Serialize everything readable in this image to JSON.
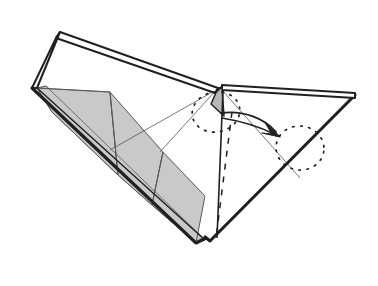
{
  "figure": {
    "type": "origami-instruction",
    "background_color": "#ffffff",
    "canvas": {
      "width": 378,
      "height": 286
    }
  },
  "palette": {
    "paper_white": "#ffffff",
    "paper_gray": "#c9c9c9",
    "paper_gray_dark": "#b8b8b8",
    "outline_dark": "#231f20",
    "outline_thin": "#3a3a3a",
    "crease_line": "#555555",
    "arrow_color": "#231f20",
    "dotted_color": "#231f20"
  },
  "strokes": {
    "heavy_outline_width": 3.1,
    "outline_width": 2.0,
    "thin_crease_width": 0.8,
    "dash_pattern": "6 7",
    "dot_pattern": "1.6 6.5",
    "arrow_width": 1.9
  },
  "shapes": {
    "left_wing_fold_strip": {
      "name": "left-wing-folded-top-edge",
      "points": "60,32 218,88 215,93 56,38"
    },
    "left_wing_left_edge_strip": {
      "name": "left-wing-left-edge",
      "points": "60,32 56,38 32,88 37,88"
    },
    "left_wing_white_panel": {
      "name": "left-wing-white-panel",
      "points": "60,34 216,90 160,150 110,124 37,88"
    },
    "left_wing_gray_upper": {
      "name": "left-wing-gray-upper-panel",
      "points": "37,88 110,92 118,175 52,112"
    },
    "left_wing_gray_mid": {
      "name": "left-wing-gray-mid-panel",
      "points": "110,92 163,152 152,205 118,175"
    },
    "left_wing_gray_lower": {
      "name": "left-wing-gray-lower-panel",
      "points": "152,205 163,152 205,196 196,243"
    },
    "left_wing_gray_band": {
      "name": "left-wing-gray-outer-band",
      "points": "37,88 52,112 118,175 152,205 196,243 205,240 118,150 46,86"
    },
    "center_white_panel": {
      "name": "center-white-panel",
      "points": "110,92 216,90 222,113 216,238 205,196 163,152"
    },
    "notch_gray_triangle": {
      "name": "notch-gray-triangle",
      "points": "218,88 222,88 224,116 211,104"
    },
    "right_wing_fold_strip": {
      "name": "right-wing-folded-top-edge",
      "points": "222,85 355,93 355,98 222,90"
    },
    "right_wing_panel": {
      "name": "right-wing-white-panel",
      "points": "222,90 355,96 212,240"
    },
    "right_wing_bottom_edge": {
      "name": "right-wing-bottom-diagonal-edge",
      "points": "355,95 212,240 206,236 352,91"
    },
    "notch_vertical_edge": {
      "name": "notch-vertical-edge",
      "from": "222,88",
      "to": "216,238"
    }
  },
  "creases": [
    {
      "name": "crease-left-upper",
      "d": "M 37,88 L 110,92"
    },
    {
      "name": "crease-left-diagonal",
      "d": "M 110,92 L 163,152"
    },
    {
      "name": "crease-left-vertical",
      "d": "M 110,92 L 118,175"
    },
    {
      "name": "crease-left-lower-diagonal",
      "d": "M 163,152 L 152,205"
    },
    {
      "name": "crease-left-inner-band",
      "d": "M 46,86 L 205,240"
    },
    {
      "name": "crease-center-diagonal",
      "d": "M 216,90 L 110,150"
    },
    {
      "name": "crease-center-lower",
      "d": "M 163,152 L 205,196"
    },
    {
      "name": "crease-right-diagonal",
      "d": "M 222,90 L 300,178"
    },
    {
      "name": "crease-notch-left",
      "d": "M 218,88 L 160,152"
    }
  ],
  "dashed_lines": [
    {
      "name": "hidden-fold-line",
      "d": "M 232,112 L 216,238"
    }
  ],
  "dotted_ellipses": [
    {
      "name": "dotted-ellipse-notch",
      "cx": 216,
      "cy": 112,
      "rx": 24,
      "ry": 20,
      "rotation": -12
    },
    {
      "name": "dotted-ellipse-target",
      "cx": 300,
      "cy": 148,
      "rx": 24,
      "ry": 22,
      "rotation": 8
    }
  ],
  "arrow": {
    "name": "fold-direction-arrow",
    "path": "M 221,113 C 243,110 264,118 276,132",
    "secondary_path": "M 222,118 C 246,122 262,128 274,134",
    "head": "276,134 266,126 271,137 262,139",
    "label": ""
  },
  "annotations": {
    "description": "Paper model shown mid-fold with a notch at the center; curved arrow indicates the flap rotates to the right toward the dotted outline.",
    "arrow_meaning": "fold-this-flap-over",
    "dotted_meaning": "resulting-position-outline",
    "dashed_meaning": "hidden-edge-behind-paper",
    "gray_meaning": "reverse-side-of-paper"
  }
}
